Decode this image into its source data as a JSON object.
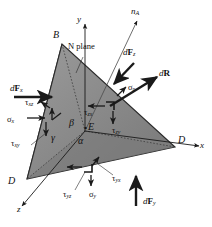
{
  "figure": {
    "type": "engineering-mechanics-diagram",
    "background": "#ffffff",
    "face_fill_front": "#8a8a8a",
    "face_fill_left": "#a0a0a0",
    "face_fill_top": "#9a9a9a",
    "stroke": "#1a1a1a"
  },
  "axes": [
    {
      "key": "y",
      "label": "y",
      "direction": "up",
      "tip": [
        82,
        18
      ]
    },
    {
      "key": "x",
      "label": "x",
      "direction": "right",
      "tip": [
        204,
        148
      ]
    },
    {
      "key": "z",
      "label": "z",
      "direction": "down-left",
      "tip": [
        15,
        212
      ]
    },
    {
      "key": "n",
      "label": "n",
      "sub": "A",
      "direction": "up-right-oblique",
      "tip": [
        139,
        16
      ]
    }
  ],
  "vertices": [
    {
      "key": "B",
      "label": "B",
      "x": 55,
      "y": 36
    },
    {
      "key": "C",
      "label": "C",
      "x": 9,
      "y": 182
    },
    {
      "key": "D",
      "label": "D",
      "x": 181,
      "y": 140
    },
    {
      "key": "E",
      "label": "E",
      "x": 91,
      "y": 127
    }
  ],
  "plane": {
    "label": "N plane",
    "x": 68,
    "y": 47
  },
  "angles": [
    {
      "key": "alpha",
      "label": "α",
      "x": 80,
      "y": 137
    },
    {
      "key": "beta",
      "label": "β",
      "x": 71,
      "y": 123
    },
    {
      "key": "gamma",
      "label": "γ",
      "x": 53,
      "y": 137
    }
  ],
  "forces": [
    {
      "key": "dFx",
      "base": "dF",
      "sub": "x",
      "bold": "F",
      "x": 10,
      "y": 88
    },
    {
      "key": "dFy",
      "base": "dF",
      "sub": "y",
      "bold": "F",
      "x": 143,
      "y": 200
    },
    {
      "key": "dFz",
      "base": "dF",
      "sub": "z",
      "bold": "F",
      "x": 124,
      "y": 52
    },
    {
      "key": "dR",
      "base": "dR",
      "sub": "",
      "bold": "R",
      "x": 160,
      "y": 73
    }
  ],
  "stresses": [
    {
      "key": "tau_xz",
      "sym": "τ",
      "sub": "xz",
      "x": 25,
      "y": 101
    },
    {
      "key": "sigma_x",
      "sym": "σ",
      "sub": "x",
      "x": 8,
      "y": 119
    },
    {
      "key": "tau_xy",
      "sym": "τ",
      "sub": "xy",
      "x": 12,
      "y": 140
    },
    {
      "key": "tau_zx",
      "sym": "τ",
      "sub": "zx",
      "x": 85,
      "y": 113
    },
    {
      "key": "tau_zy",
      "sym": "τ",
      "sub": "zy",
      "x": 110,
      "y": 128
    },
    {
      "key": "sigma_n",
      "sym": "σ",
      "sub": "n",
      "x": 123,
      "y": 88
    },
    {
      "key": "tau_yz",
      "sym": "τ",
      "sub": "yz",
      "x": 64,
      "y": 194
    },
    {
      "key": "sigma_y",
      "sym": "σ",
      "sub": "y",
      "x": 92,
      "y": 193
    },
    {
      "key": "tau_yx",
      "sym": "τ",
      "sub": "yx",
      "x": 109,
      "y": 177
    }
  ]
}
